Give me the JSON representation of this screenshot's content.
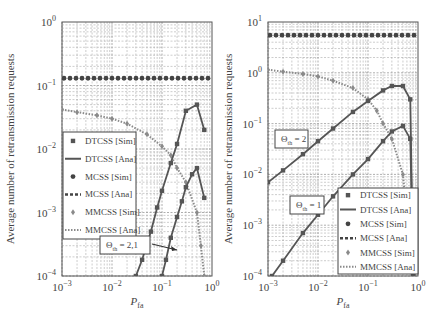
{
  "chart_data": [
    {
      "type": "line",
      "title": "",
      "xlabel": "P_fa",
      "ylabel": "Average number of retransmission requests",
      "xscale": "log",
      "yscale": "log",
      "xlim": [
        0.001,
        1
      ],
      "ylim": [
        0.0001,
        1
      ],
      "grid": true,
      "x_ticks": [
        "10^-3",
        "10^-2",
        "10^-1",
        "10^0"
      ],
      "y_ticks": [
        "10^-4",
        "10^-3",
        "10^-2",
        "10^-1",
        "10^0"
      ],
      "legend_position": "left-middle",
      "legend": [
        "DTCSS [Sim]",
        "DTCSS [Ana]",
        "MCSS [Sim]",
        "MCSS [Ana]",
        "MMCSS [Sim]",
        "MMCSS [Ana]"
      ],
      "annotations": [
        {
          "text": "Θ_th = 2,1",
          "arrow_to": [
            0.2,
            0.00025
          ]
        }
      ],
      "series": [
        {
          "name": "MCSS",
          "x": [
            0.001,
            0.002,
            0.005,
            0.01,
            0.02,
            0.05,
            0.1,
            0.2,
            0.5,
            1.0
          ],
          "y": [
            0.13,
            0.13,
            0.13,
            0.13,
            0.13,
            0.13,
            0.13,
            0.13,
            0.13,
            0.13
          ]
        },
        {
          "name": "MMCSS",
          "x": [
            0.001,
            0.002,
            0.005,
            0.01,
            0.02,
            0.05,
            0.1,
            0.15,
            0.2,
            0.3,
            0.5,
            0.6,
            0.7
          ],
          "y": [
            0.042,
            0.038,
            0.034,
            0.03,
            0.025,
            0.017,
            0.011,
            0.008,
            0.005,
            0.003,
            0.001,
            0.0003,
            0.0001
          ]
        },
        {
          "name": "DTCSS (Θ_th = 2)",
          "x": [
            0.03,
            0.04,
            0.06,
            0.08,
            0.1,
            0.15,
            0.2,
            0.3,
            0.5,
            0.7
          ],
          "y": [
            0.0001,
            0.00018,
            0.0005,
            0.0012,
            0.0022,
            0.006,
            0.012,
            0.04,
            0.05,
            0.02
          ]
        },
        {
          "name": "DTCSS (Θ_th = 1)",
          "x": [
            0.1,
            0.12,
            0.15,
            0.2,
            0.25,
            0.3,
            0.4,
            0.5,
            0.7
          ],
          "y": [
            0.0001,
            0.00018,
            0.0004,
            0.00085,
            0.0015,
            0.0025,
            0.004,
            0.005,
            0.0017
          ]
        }
      ]
    },
    {
      "type": "line",
      "title": "",
      "xlabel": "P_fa",
      "ylabel": "Average number of retransmission requests",
      "xscale": "log",
      "yscale": "log",
      "xlim": [
        0.001,
        1
      ],
      "ylim": [
        0.0001,
        10
      ],
      "grid": true,
      "x_ticks": [
        "10^-3",
        "10^-2",
        "10^-1",
        "10^0"
      ],
      "y_ticks": [
        "10^-4",
        "10^-3",
        "10^-2",
        "10^-1",
        "10^0",
        "10^1"
      ],
      "legend_position": "lower-right",
      "legend": [
        "DTCSS [Sim]",
        "DTCSS [Ana]",
        "MCSS [Sim]",
        "MCSS [Ana]",
        "MMCSS [Sim]",
        "MMCSS [Ana]"
      ],
      "annotations": [
        {
          "text": "Θ_th = 2"
        },
        {
          "text": "Θ_th = 1"
        }
      ],
      "series": [
        {
          "name": "MCSS",
          "x": [
            0.001,
            0.002,
            0.005,
            0.01,
            0.02,
            0.05,
            0.1,
            0.2,
            0.5,
            1.0
          ],
          "y": [
            5.5,
            5.5,
            5.5,
            5.5,
            5.5,
            5.5,
            5.5,
            5.5,
            5.5,
            5.5
          ]
        },
        {
          "name": "MMCSS",
          "x": [
            0.001,
            0.002,
            0.005,
            0.01,
            0.02,
            0.05,
            0.1,
            0.15,
            0.2,
            0.3,
            0.5,
            0.7
          ],
          "y": [
            1.15,
            1.05,
            0.95,
            0.85,
            0.7,
            0.5,
            0.3,
            0.18,
            0.1,
            0.05,
            0.01,
            0.0003
          ]
        },
        {
          "name": "DTCSS (Θ_th = 2)",
          "x": [
            0.001,
            0.002,
            0.005,
            0.01,
            0.02,
            0.05,
            0.1,
            0.2,
            0.3,
            0.5,
            0.7,
            0.8
          ],
          "y": [
            0.007,
            0.012,
            0.025,
            0.045,
            0.08,
            0.17,
            0.28,
            0.45,
            0.55,
            0.55,
            0.3,
            0.0001
          ]
        },
        {
          "name": "DTCSS (Θ_th = 1)",
          "x": [
            0.0012,
            0.002,
            0.005,
            0.01,
            0.02,
            0.05,
            0.1,
            0.2,
            0.3,
            0.5,
            0.7,
            0.8
          ],
          "y": [
            0.0001,
            0.0002,
            0.0007,
            0.0016,
            0.0037,
            0.01,
            0.02,
            0.045,
            0.07,
            0.09,
            0.05,
            0.0001
          ]
        }
      ]
    }
  ],
  "labels": {
    "ylabel": "Average number of retransmission requests",
    "xlabel_main": "P",
    "xlabel_sub": "fa",
    "legend": [
      "DTCSS [Sim]",
      "DTCSS [Ana]",
      "MCSS [Sim]",
      "MCSS [Ana]",
      "MMCSS [Sim]",
      "MMCSS [Ana]"
    ],
    "left_annotation": "Θ   = 2,1",
    "left_annotation_sub": "th",
    "right_annotation_top": "Θ   = 2",
    "right_annotation_bottom": "Θ   = 1",
    "right_annotation_sub": "th"
  },
  "colors": {
    "mcss": "#444444",
    "dtcss": "#555555",
    "mmcss": "#8a8a8a",
    "grid": "#9a9a9a"
  }
}
